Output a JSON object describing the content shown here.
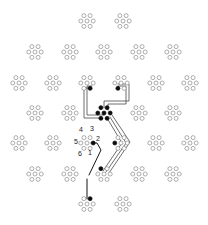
{
  "figure": {
    "title": "",
    "kind": "network-lattice-routing-diagram",
    "canvas": {
      "width": 208,
      "height": 225,
      "background": "#ffffff"
    },
    "colors": {
      "node_open_stroke": "#8a8a8a",
      "node_open_fill": "#ffffff",
      "node_filled": "#0d0d0d",
      "route": "#4a4a4a",
      "route_dark": "#151515",
      "label": "#1a1a1a"
    }
  },
  "cluster_layout": {
    "nodes_per_cluster": 7,
    "arrangement": "hexagon-with-center",
    "hex_radius": 6.2,
    "node_radius": 2.0,
    "offsets": [
      {
        "index": 0,
        "role": "center",
        "dx": 0.0,
        "dy": 0.0
      },
      {
        "index": 1,
        "role": "hex",
        "dx": 3.1,
        "dy": 5.37
      },
      {
        "index": 2,
        "role": "hex",
        "dx": 6.2,
        "dy": 0.0
      },
      {
        "index": 3,
        "role": "hex",
        "dx": 3.1,
        "dy": -5.37
      },
      {
        "index": 4,
        "role": "hex",
        "dx": -3.1,
        "dy": -5.37
      },
      {
        "index": 5,
        "role": "hex",
        "dx": -6.2,
        "dy": 0.0
      },
      {
        "index": 6,
        "role": "hex",
        "dx": -3.1,
        "dy": 5.37
      }
    ]
  },
  "clusters": [
    {
      "id": "r0c0",
      "cx": 87,
      "cy": 21,
      "filled": []
    },
    {
      "id": "r0c1",
      "cx": 123,
      "cy": 21,
      "filled": []
    },
    {
      "id": "r1c0",
      "cx": 35,
      "cy": 52,
      "filled": []
    },
    {
      "id": "r1c1",
      "cx": 70,
      "cy": 52,
      "filled": []
    },
    {
      "id": "r1c2",
      "cx": 104,
      "cy": 52,
      "filled": []
    },
    {
      "id": "r1c3",
      "cx": 139,
      "cy": 52,
      "filled": []
    },
    {
      "id": "r1c4",
      "cx": 173,
      "cy": 52,
      "filled": []
    },
    {
      "id": "r2c0",
      "cx": 19,
      "cy": 83,
      "filled": []
    },
    {
      "id": "r2c1",
      "cx": 53,
      "cy": 83,
      "filled": []
    },
    {
      "id": "r2c2",
      "cx": 87,
      "cy": 83,
      "filled": [
        1
      ]
    },
    {
      "id": "r2c3",
      "cx": 121,
      "cy": 83,
      "filled": [
        6
      ]
    },
    {
      "id": "r2c4",
      "cx": 156,
      "cy": 83,
      "filled": []
    },
    {
      "id": "r2c5",
      "cx": 190,
      "cy": 83,
      "filled": []
    },
    {
      "id": "r3c0",
      "cx": 35,
      "cy": 113,
      "filled": []
    },
    {
      "id": "r3c1",
      "cx": 70,
      "cy": 113,
      "filled": []
    },
    {
      "id": "r3c2",
      "cx": 104,
      "cy": 113,
      "filled": [
        0,
        1,
        2,
        3,
        4,
        5,
        6
      ]
    },
    {
      "id": "r3c3",
      "cx": 139,
      "cy": 113,
      "filled": []
    },
    {
      "id": "r3c4",
      "cx": 173,
      "cy": 113,
      "filled": []
    },
    {
      "id": "r4c0",
      "cx": 19,
      "cy": 143,
      "filled": []
    },
    {
      "id": "r4c1",
      "cx": 53,
      "cy": 143,
      "filled": []
    },
    {
      "id": "r4c2",
      "cx": 87,
      "cy": 143,
      "filled": [
        2
      ]
    },
    {
      "id": "r4c3",
      "cx": 121,
      "cy": 143,
      "filled": [
        5
      ]
    },
    {
      "id": "r4c4",
      "cx": 156,
      "cy": 143,
      "filled": []
    },
    {
      "id": "r4c5",
      "cx": 190,
      "cy": 143,
      "filled": []
    },
    {
      "id": "r5c0",
      "cx": 35,
      "cy": 174,
      "filled": []
    },
    {
      "id": "r5c1",
      "cx": 70,
      "cy": 174,
      "filled": []
    },
    {
      "id": "r5c2",
      "cx": 104,
      "cy": 174,
      "filled": [
        4
      ]
    },
    {
      "id": "r5c3",
      "cx": 139,
      "cy": 174,
      "filled": []
    },
    {
      "id": "r5c4",
      "cx": 173,
      "cy": 174,
      "filled": []
    },
    {
      "id": "r6c0",
      "cx": 87,
      "cy": 204,
      "filled": [
        3
      ]
    },
    {
      "id": "r6c1",
      "cx": 123,
      "cy": 204,
      "filled": []
    }
  ],
  "index_labels": [
    {
      "text": "1",
      "x": 90,
      "y": 155
    },
    {
      "text": "2",
      "x": 98,
      "y": 141
    },
    {
      "text": "3",
      "x": 92,
      "y": 131
    },
    {
      "text": "4",
      "x": 81,
      "y": 132
    },
    {
      "text": "5",
      "x": 76,
      "y": 144
    },
    {
      "text": "6",
      "x": 80,
      "y": 156
    }
  ],
  "routes": [
    {
      "id": "route-a",
      "style": "route",
      "points": "90,88 84,88 84,118 101,118"
    },
    {
      "id": "route-b",
      "style": "route",
      "points": "92,86 87,86 87,115 104,115"
    },
    {
      "id": "route-c",
      "style": "route",
      "points": "118,86 126,86 126,104 108,104 108,110"
    },
    {
      "id": "route-d",
      "style": "route",
      "points": "118,84 129,84 129,101 104,101 104,108"
    },
    {
      "id": "route-e",
      "style": "route",
      "points": "107,118 122,143 103,171"
    },
    {
      "id": "route-f",
      "style": "route",
      "points": "110,117 126,143 106,172"
    },
    {
      "id": "route-g",
      "style": "route",
      "points": "112,115 130,142 109,173"
    },
    {
      "id": "route-h",
      "style": "route-dark",
      "points": "91,143 97,143 101,150 89,175"
    },
    {
      "id": "route-i",
      "style": "route-dark",
      "points": "87,179 87,199"
    }
  ]
}
